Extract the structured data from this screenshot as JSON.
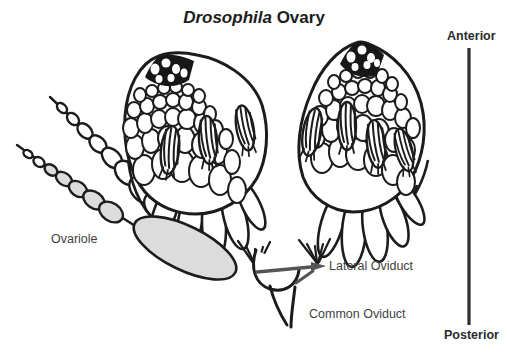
{
  "title": {
    "genus": "Drosophila",
    "rest": " Ovary"
  },
  "labels": {
    "ovariole": "Ovariole",
    "lateral_oviduct": "Lateral Oviduct",
    "common_oviduct": "Common Oviduct"
  },
  "axis": {
    "top_label": "Anterior",
    "bottom_label": "Posterior"
  },
  "colors": {
    "ink": "#1c1c1c",
    "shaded_chamber": "#dcdcdc",
    "label_text": "#3f3f3f",
    "axis_text": "#2b2b2b",
    "leader_arrow": "#555555"
  }
}
